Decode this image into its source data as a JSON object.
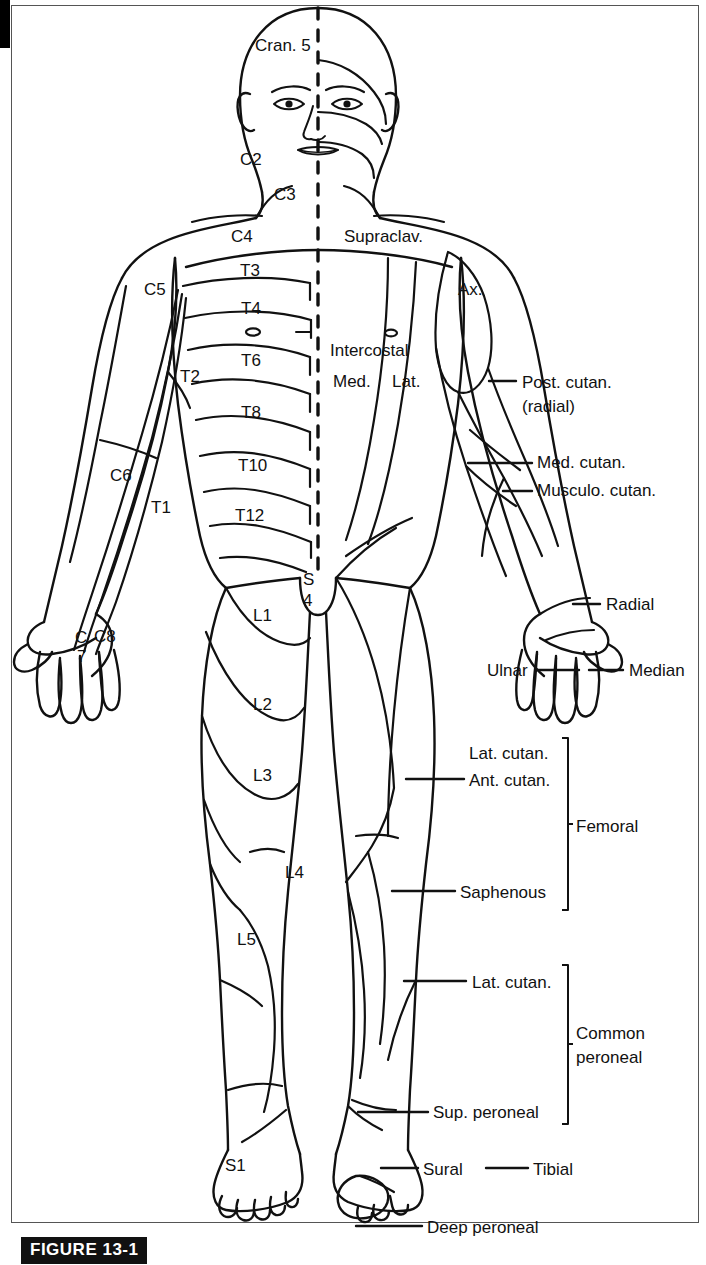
{
  "figure": {
    "caption": "FIGURE 13-1"
  },
  "page": {
    "width": 706,
    "height": 1265,
    "background": "#ffffff",
    "ink": "#111111"
  },
  "dermatomes": {
    "side": "left (viewer's left) — segmental / spinal nerve dermatomes",
    "labels": [
      {
        "id": "cran5",
        "text": "Cran. 5",
        "x": 255,
        "y": 37
      },
      {
        "id": "c2",
        "text": "C2",
        "x": 240,
        "y": 151
      },
      {
        "id": "c3",
        "text": "C3",
        "x": 274,
        "y": 186
      },
      {
        "id": "c4",
        "text": "C4",
        "x": 231,
        "y": 228
      },
      {
        "id": "c5",
        "text": "C5",
        "x": 144,
        "y": 281
      },
      {
        "id": "t3",
        "text": "T3",
        "x": 240,
        "y": 262
      },
      {
        "id": "t4",
        "text": "T4",
        "x": 241,
        "y": 300
      },
      {
        "id": "t6",
        "text": "T6",
        "x": 241,
        "y": 352
      },
      {
        "id": "t2",
        "text": "T2",
        "x": 180,
        "y": 368
      },
      {
        "id": "t8",
        "text": "T8",
        "x": 241,
        "y": 404
      },
      {
        "id": "c6",
        "text": "C6",
        "x": 110,
        "y": 467
      },
      {
        "id": "t10",
        "text": "T10",
        "x": 238,
        "y": 457
      },
      {
        "id": "t1",
        "text": "T1",
        "x": 151,
        "y": 499
      },
      {
        "id": "t12",
        "text": "T12",
        "x": 235,
        "y": 507
      },
      {
        "id": "c7",
        "text": "C",
        "x": 75,
        "y": 629
      },
      {
        "id": "c7b",
        "text": "7",
        "x": 77,
        "y": 648
      },
      {
        "id": "c8",
        "text": "C8",
        "x": 94,
        "y": 628
      },
      {
        "id": "s",
        "text": "S",
        "x": 303,
        "y": 571
      },
      {
        "id": "s4",
        "text": "4",
        "x": 303,
        "y": 592
      },
      {
        "id": "l1",
        "text": "L1",
        "x": 253,
        "y": 607
      },
      {
        "id": "l2",
        "text": "L2",
        "x": 253,
        "y": 696
      },
      {
        "id": "l3",
        "text": "L3",
        "x": 253,
        "y": 767
      },
      {
        "id": "l4",
        "text": "L4",
        "x": 285,
        "y": 864
      },
      {
        "id": "l5",
        "text": "L5",
        "x": 237,
        "y": 931
      },
      {
        "id": "s1",
        "text": "S1",
        "x": 225,
        "y": 1157
      }
    ]
  },
  "nerves": {
    "side": "right (viewer's right) — peripheral cutaneous nerves",
    "labels": [
      {
        "id": "supraclav",
        "text": "Supraclav.",
        "x": 344,
        "y": 228
      },
      {
        "id": "ax",
        "text": "Ax.",
        "x": 458,
        "y": 281
      },
      {
        "id": "intercostal",
        "text": "Intercostal",
        "x": 330,
        "y": 342
      },
      {
        "id": "med",
        "text": "Med.",
        "x": 333,
        "y": 373
      },
      {
        "id": "lat",
        "text": "Lat.",
        "x": 392,
        "y": 373
      },
      {
        "id": "post_cutan",
        "text": "Post. cutan.",
        "x": 522,
        "y": 374
      },
      {
        "id": "post_radial",
        "text": "(radial)",
        "x": 522,
        "y": 398
      },
      {
        "id": "med_cutan",
        "text": "Med. cutan.",
        "x": 537,
        "y": 454
      },
      {
        "id": "musculo",
        "text": "Musculo. cutan.",
        "x": 537,
        "y": 482
      },
      {
        "id": "radial",
        "text": "Radial",
        "x": 606,
        "y": 596
      },
      {
        "id": "ulnar",
        "text": "Ulnar",
        "x": 487,
        "y": 662
      },
      {
        "id": "median",
        "text": "Median",
        "x": 629,
        "y": 662
      },
      {
        "id": "lat_cutan_th",
        "text": "Lat. cutan.",
        "x": 469,
        "y": 745
      },
      {
        "id": "ant_cutan",
        "text": "Ant. cutan.",
        "x": 469,
        "y": 772
      },
      {
        "id": "femoral",
        "text": "Femoral",
        "x": 576,
        "y": 818
      },
      {
        "id": "saphenous",
        "text": "Saphenous",
        "x": 460,
        "y": 884
      },
      {
        "id": "lat_cutan_lg",
        "text": "Lat. cutan.",
        "x": 472,
        "y": 974
      },
      {
        "id": "common",
        "text": "Common",
        "x": 576,
        "y": 1025
      },
      {
        "id": "peroneal",
        "text": "peroneal",
        "x": 576,
        "y": 1049
      },
      {
        "id": "sup_peroneal",
        "text": "Sup. peroneal",
        "x": 433,
        "y": 1104
      },
      {
        "id": "sural",
        "text": "Sural",
        "x": 423,
        "y": 1161
      },
      {
        "id": "tibial",
        "text": "Tibial",
        "x": 533,
        "y": 1161
      },
      {
        "id": "deep_peroneal",
        "text": "Deep peroneal",
        "x": 427,
        "y": 1219
      }
    ],
    "brackets": [
      {
        "id": "femoral-bracket",
        "label": "Femoral",
        "x": 566,
        "y1": 738,
        "y2": 910
      },
      {
        "id": "peroneal-bracket",
        "label": "Common peroneal",
        "x": 566,
        "y1": 965,
        "y2": 1124
      }
    ]
  }
}
